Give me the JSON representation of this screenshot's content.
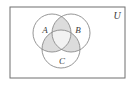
{
  "figure": {
    "type": "venn-diagram",
    "width": 133,
    "height": 86,
    "background_color": "#ffffff"
  },
  "universe": {
    "label": "U",
    "label_x": 117,
    "label_y": 17,
    "rect": {
      "x": 10,
      "y": 7,
      "width": 115,
      "height": 71
    },
    "border_color": "#6f6f6f",
    "fill_color": "#ffffff",
    "border_width": 1
  },
  "circles": [
    {
      "id": "A",
      "label": "A",
      "cx": 52,
      "cy": 33,
      "r": 19,
      "label_x": 45,
      "label_y": 31,
      "stroke": "#8a8a8a",
      "fill": "none"
    },
    {
      "id": "B",
      "label": "B",
      "cx": 71,
      "cy": 33,
      "r": 19,
      "label_x": 78,
      "label_y": 31,
      "stroke": "#8a8a8a",
      "fill": "none"
    },
    {
      "id": "C",
      "label": "C",
      "cx": 61,
      "cy": 49,
      "r": 19,
      "label_x": 62,
      "label_y": 62,
      "stroke": "#8a8a8a",
      "fill": "none"
    }
  ],
  "shading": {
    "pairwise_intersection_color": "#dcdcdc",
    "triple_intersection_color": "#f2f2f2",
    "shaded_regions": [
      "A∩B",
      "A∩C",
      "B∩C"
    ],
    "unshaded_regions": [
      "A only",
      "B only",
      "C only",
      "A∩B∩C",
      "outside circles"
    ]
  },
  "icons": {
    "circle_a": "circle-icon",
    "circle_b": "circle-icon",
    "circle_c": "circle-icon",
    "universe_rect": "rectangle-icon"
  }
}
